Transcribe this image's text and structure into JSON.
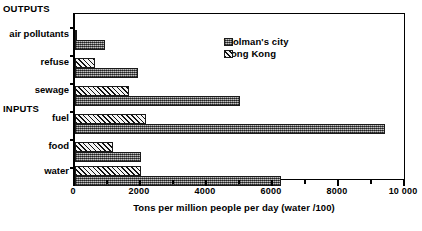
{
  "chart_data": {
    "type": "bar",
    "orientation": "horizontal",
    "title": "",
    "xlabel": "Tons per million people per day (water  /100)",
    "ylabel": "",
    "xlim": [
      0,
      10000
    ],
    "xticks": [
      0,
      2000,
      4000,
      6000,
      8000,
      10000
    ],
    "xticklabels": [
      "0",
      "2000",
      "4000",
      "6000",
      "8000",
      "10 000"
    ],
    "minor_tick_step": 1000,
    "grid": false,
    "legend_position": "upper right inside",
    "group_labels": [
      "OUTPUTS",
      "INPUTS"
    ],
    "categories": [
      "air pollutants",
      "refuse",
      "sewage",
      "fuel",
      "food",
      "water"
    ],
    "category_groups": [
      "OUTPUTS",
      "OUTPUTS",
      "OUTPUTS",
      "INPUTS",
      "INPUTS",
      "INPUTS"
    ],
    "series": [
      {
        "name": "Wolman's city",
        "fill": "dotted-gray",
        "color": "#8a8a8a",
        "values": [
          900,
          1900,
          5000,
          9400,
          2000,
          6250
        ]
      },
      {
        "name": "Hong Kong",
        "fill": "diagonal-hatch",
        "color": "#f2f2f2",
        "values": [
          60,
          620,
          1650,
          2150,
          1150,
          2000
        ]
      }
    ]
  },
  "legend": {
    "items": [
      {
        "label": "Wolman's city",
        "fill": "dotted-gray"
      },
      {
        "label": "Hong Kong",
        "fill": "diagonal-hatch"
      }
    ]
  },
  "axis": {
    "x_title": "Tons per million people per day (water  /100)",
    "tick_labels": [
      "0",
      "2000",
      "4000",
      "6000",
      "8000",
      "10 000"
    ]
  },
  "labels": {
    "outputs": "OUTPUTS",
    "inputs": "INPUTS",
    "air_pollutants": "air pollutants",
    "refuse": "refuse",
    "sewage": "sewage",
    "fuel": "fuel",
    "food": "food",
    "water": "water"
  }
}
